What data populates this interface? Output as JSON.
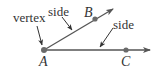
{
  "diagram": {
    "type": "angle",
    "colors": {
      "stroke": "#555555",
      "point": "#6a6a6a",
      "text": "#333333"
    },
    "vertex": {
      "name": "A",
      "x": 44,
      "y": 50
    },
    "points": [
      {
        "name": "B",
        "x": 95,
        "y": 19
      },
      {
        "name": "C",
        "x": 126,
        "y": 50
      }
    ],
    "rays": [
      {
        "from": "A",
        "through": "B",
        "end": [
          113,
          9
        ]
      },
      {
        "from": "A",
        "through": "C",
        "end": [
          150,
          50
        ]
      }
    ],
    "labels": {
      "vertex": "vertex",
      "side_upper": "side",
      "side_lower": "side",
      "A": "A",
      "B": "B",
      "C": "C"
    }
  }
}
